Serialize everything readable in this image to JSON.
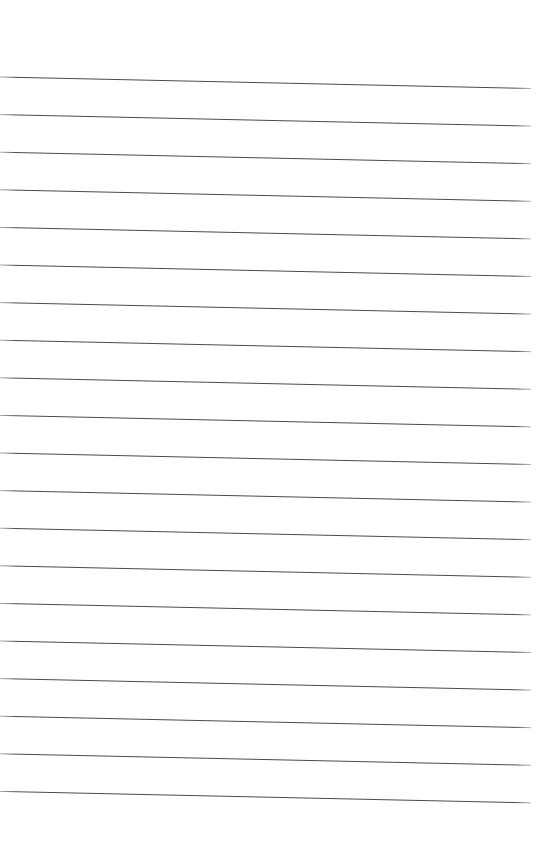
{
  "page": {
    "kind": "lined-paper",
    "width": 536,
    "height": 866,
    "background_color": "#ffffff",
    "content_text": ""
  },
  "ruling": {
    "line_color": "#4a4a4a",
    "line_color_light": "#6e6e6e",
    "line_thickness": 1,
    "line_count": 20,
    "line_spacing": 37.6,
    "first_line_y_left": 77,
    "last_line_y_left": 792,
    "x_start": 0,
    "x_end": 531,
    "slant_drop": 11.5,
    "top_margin": 77,
    "bottom_margin": 74,
    "lines": [
      {
        "index": 1,
        "y_left": 77.0,
        "y_right": 88.5
      },
      {
        "index": 2,
        "y_left": 114.6,
        "y_right": 126.1
      },
      {
        "index": 3,
        "y_left": 152.2,
        "y_right": 163.7
      },
      {
        "index": 4,
        "y_left": 189.8,
        "y_right": 201.3
      },
      {
        "index": 5,
        "y_left": 227.4,
        "y_right": 238.9
      },
      {
        "index": 6,
        "y_left": 265.0,
        "y_right": 276.5
      },
      {
        "index": 7,
        "y_left": 302.6,
        "y_right": 314.1
      },
      {
        "index": 8,
        "y_left": 340.2,
        "y_right": 351.7
      },
      {
        "index": 9,
        "y_left": 377.8,
        "y_right": 389.3
      },
      {
        "index": 10,
        "y_left": 415.4,
        "y_right": 426.9
      },
      {
        "index": 11,
        "y_left": 453.0,
        "y_right": 464.5
      },
      {
        "index": 12,
        "y_left": 490.6,
        "y_right": 502.1
      },
      {
        "index": 13,
        "y_left": 528.2,
        "y_right": 539.7
      },
      {
        "index": 14,
        "y_left": 565.8,
        "y_right": 577.3
      },
      {
        "index": 15,
        "y_left": 603.4,
        "y_right": 614.9
      },
      {
        "index": 16,
        "y_left": 641.0,
        "y_right": 652.5
      },
      {
        "index": 17,
        "y_left": 678.6,
        "y_right": 690.1
      },
      {
        "index": 18,
        "y_left": 716.2,
        "y_right": 727.7
      },
      {
        "index": 19,
        "y_left": 753.8,
        "y_right": 765.3
      },
      {
        "index": 20,
        "y_left": 791.4,
        "y_right": 802.9
      }
    ]
  }
}
